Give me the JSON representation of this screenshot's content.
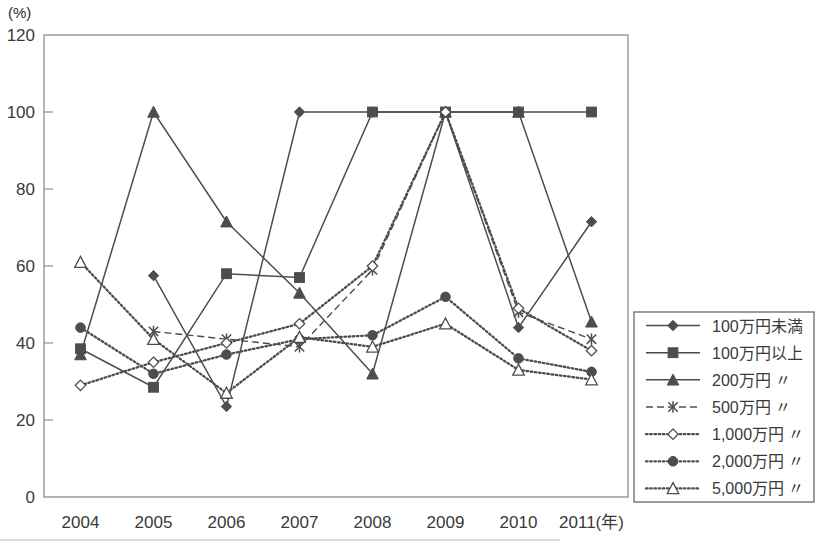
{
  "axis_unit_label": "(%)",
  "chart_data": {
    "type": "line",
    "title": "",
    "xlabel": "(年)",
    "ylabel": "(%)",
    "categories": [
      "2004",
      "2005",
      "2006",
      "2007",
      "2008",
      "2009",
      "2010",
      "2011"
    ],
    "x_axis_suffix": "(年)",
    "ylim": [
      0,
      120
    ],
    "yticks": [
      0,
      20,
      40,
      60,
      80,
      100,
      120
    ],
    "grid": false,
    "legend_position": "right",
    "series": [
      {
        "name": "100万円未満",
        "marker": "filled-diamond",
        "line_style": "solid",
        "values": [
          null,
          57.5,
          23.5,
          100,
          100,
          100,
          44,
          71.5
        ]
      },
      {
        "name": "100万円以上",
        "marker": "filled-square",
        "line_style": "solid",
        "values": [
          38.5,
          28.5,
          58,
          57,
          100,
          100,
          100,
          100
        ]
      },
      {
        "name": "200万円 〃",
        "marker": "filled-triangle",
        "line_style": "solid",
        "values": [
          37,
          100,
          71.5,
          53,
          32,
          100,
          100,
          45.5
        ]
      },
      {
        "name": "500万円 〃",
        "marker": "cross",
        "line_style": "dashed",
        "values": [
          null,
          43,
          41,
          39,
          59,
          100,
          48,
          41
        ]
      },
      {
        "name": "1,000万円 〃",
        "marker": "open-diamond",
        "line_style": "dotted",
        "values": [
          29,
          35,
          40,
          45,
          60,
          100,
          49,
          38
        ]
      },
      {
        "name": "2,000万円 〃",
        "marker": "filled-circle",
        "line_style": "dotted",
        "values": [
          44,
          32,
          37,
          41,
          42,
          52,
          36,
          32.5
        ]
      },
      {
        "name": "5,000万円 〃",
        "marker": "open-triangle",
        "line_style": "dotted",
        "values": [
          61,
          41,
          27,
          41.5,
          39,
          45,
          33,
          30.5
        ]
      }
    ]
  },
  "colors": {
    "line": "#4d4d4d",
    "frame": "#8e8e8e",
    "text": "#3a3a3a"
  }
}
